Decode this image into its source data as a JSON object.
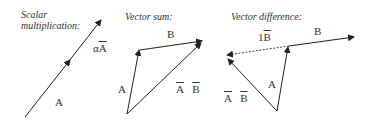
{
  "panels": [
    {
      "title_line1": "Scalar",
      "title_line2": "multiplication:",
      "labels": {
        "scaled": "αA",
        "scaled_prefix": "α",
        "scaled_vec": "A",
        "base": "A"
      }
    },
    {
      "title": "Vector sum:",
      "labels": {
        "a": "A",
        "b": "B",
        "sum_a": "A",
        "sum_b": "B"
      }
    },
    {
      "title": "Vector difference:",
      "labels": {
        "neg_b_prefix": "1",
        "neg_b": "B",
        "b": "B",
        "a": "A",
        "diff_a": "A",
        "diff_b": "B"
      }
    }
  ],
  "colors": {
    "line": "#222222",
    "text": "#333333",
    "background": "#ffffff"
  }
}
